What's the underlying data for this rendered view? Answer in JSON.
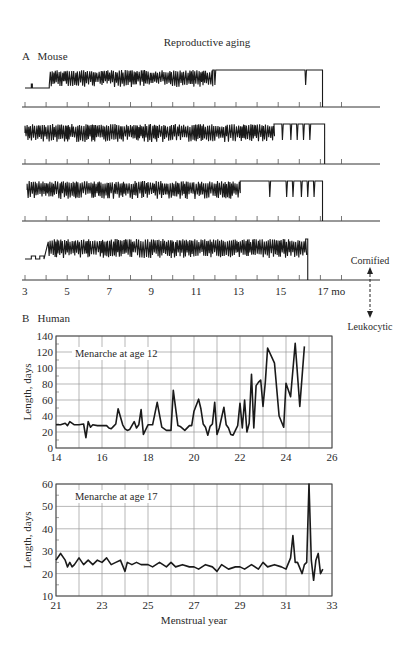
{
  "figure": {
    "title": "Reproductive aging",
    "panel_a_label": "A   Mouse",
    "panel_b_label": "B   Human",
    "state_legend": {
      "top": "Cornified",
      "bottom": "Leukocytic"
    }
  },
  "chart_data": [
    {
      "id": "mouse",
      "type": "line",
      "title": "A  Mouse",
      "xlabel": "mo",
      "x_ticks": [
        3,
        4,
        5,
        6,
        7,
        8,
        9,
        10,
        11,
        12,
        13,
        14,
        15,
        16,
        17,
        18
      ],
      "x_tick_labels": [
        "3",
        "5",
        "7",
        "9",
        "11",
        "13",
        "15",
        "17 mo"
      ],
      "xlim": [
        3,
        18
      ],
      "y_states": [
        "Leukocytic",
        "Cornified"
      ],
      "series": [
        {
          "name": "Mouse 1",
          "onset_mo": 4.2,
          "cycling_end_mo": 11.9,
          "sparse_events_mo": [
            12.0,
            16.3
          ],
          "end_mo": 17.1
        },
        {
          "name": "Mouse 2",
          "onset_mo": 3.0,
          "cycling_end_mo": 14.8,
          "sparse_events_mo": [
            15.2,
            15.6,
            15.9,
            16.2,
            16.5
          ],
          "end_mo": 17.2
        },
        {
          "name": "Mouse 3",
          "onset_mo": 3.1,
          "cycling_end_mo": 13.2,
          "sparse_events_mo": [
            14.6,
            15.4,
            15.7,
            16.1,
            16.4,
            16.7
          ],
          "end_mo": 17.1
        },
        {
          "name": "Mouse 4",
          "onset_mo": 4.1,
          "cycling_end_mo": 16.3,
          "sparse_events_mo": [],
          "end_mo": 16.4
        }
      ]
    },
    {
      "id": "human12",
      "type": "line",
      "title": "Menarche at age 12",
      "xlabel": "",
      "ylabel": "Length, days",
      "xlim": [
        14,
        26
      ],
      "ylim": [
        0,
        140
      ],
      "x_ticks": [
        14,
        16,
        18,
        20,
        22,
        24,
        26
      ],
      "y_ticks": [
        0,
        20,
        40,
        60,
        80,
        100,
        120,
        140
      ],
      "grid": true,
      "x": [
        14.0,
        14.2,
        14.4,
        14.5,
        14.6,
        14.8,
        15.0,
        15.2,
        15.3,
        15.4,
        15.5,
        15.6,
        15.8,
        16.0,
        16.2,
        16.3,
        16.4,
        16.5,
        16.6,
        16.7,
        16.9,
        17.0,
        17.1,
        17.2,
        17.3,
        17.4,
        17.5,
        17.6,
        17.7,
        17.8,
        18.0,
        18.2,
        18.4,
        18.6,
        18.8,
        19.0,
        19.1,
        19.3,
        19.4,
        19.6,
        19.8,
        19.9,
        20.0,
        20.2,
        20.3,
        20.4,
        20.5,
        20.6,
        20.7,
        20.8,
        20.9,
        21.0,
        21.1,
        21.3,
        21.4,
        21.5,
        21.6,
        21.7,
        21.9,
        22.0,
        22.1,
        22.2,
        22.3,
        22.4,
        22.5,
        22.6,
        22.7,
        22.8,
        22.9,
        23.0,
        23.1,
        23.2,
        23.5,
        23.7,
        23.9,
        24.0,
        24.2,
        24.4,
        24.6,
        24.8,
        25.0,
        25.1,
        25.3,
        25.5
      ],
      "y": [
        29,
        29,
        31,
        28,
        33,
        29,
        29,
        30,
        13,
        33,
        26,
        29,
        28,
        28,
        28,
        25,
        24,
        27,
        30,
        49,
        29,
        24,
        22,
        23,
        28,
        33,
        25,
        29,
        48,
        17,
        29,
        29,
        57,
        26,
        22,
        22,
        72,
        28,
        27,
        22,
        28,
        28,
        46,
        61,
        49,
        30,
        26,
        16,
        27,
        30,
        57,
        17,
        25,
        51,
        29,
        25,
        17,
        16,
        28,
        56,
        25,
        60,
        20,
        31,
        92,
        25,
        78,
        82,
        85,
        52,
        82,
        125,
        106,
        40,
        26,
        81,
        64,
        131,
        52,
        127
      ]
    },
    {
      "id": "human17",
      "type": "line",
      "title": "Menarche at age 17",
      "xlabel": "Menstrual year",
      "ylabel": "Length, days",
      "xlim": [
        21,
        33
      ],
      "ylim": [
        10,
        60
      ],
      "x_ticks": [
        21,
        23,
        25,
        27,
        29,
        31,
        33
      ],
      "y_ticks": [
        10,
        20,
        30,
        40,
        50,
        60
      ],
      "grid": true,
      "x": [
        21.0,
        21.2,
        21.4,
        21.5,
        21.6,
        21.7,
        21.8,
        22.0,
        22.2,
        22.4,
        22.6,
        22.8,
        23.0,
        23.2,
        23.4,
        23.6,
        23.8,
        24.0,
        24.1,
        24.3,
        24.5,
        24.7,
        25.0,
        25.2,
        25.5,
        25.8,
        26.0,
        26.2,
        26.5,
        26.8,
        27.0,
        27.2,
        27.5,
        27.8,
        28.0,
        28.2,
        28.5,
        28.8,
        29.0,
        29.2,
        29.5,
        29.8,
        30.0,
        30.2,
        30.5,
        30.8,
        31.0,
        31.2,
        31.3,
        31.4,
        31.5,
        31.7,
        31.8,
        31.9,
        32.0,
        32.1,
        32.2,
        32.3,
        32.4,
        32.5,
        32.6
      ],
      "y": [
        26,
        29,
        26,
        23,
        25,
        23,
        24,
        27,
        24,
        26,
        24,
        26,
        25,
        27,
        24,
        25,
        26,
        21,
        25,
        24,
        25,
        24,
        24,
        23,
        25,
        23,
        25,
        23,
        24,
        23,
        23,
        22,
        24,
        23,
        21,
        24,
        22,
        23,
        23,
        22,
        24,
        22,
        25,
        23,
        24,
        23,
        22,
        27,
        37,
        25,
        25,
        20,
        24,
        25,
        60,
        26,
        17,
        26,
        29,
        20,
        22
      ]
    }
  ]
}
